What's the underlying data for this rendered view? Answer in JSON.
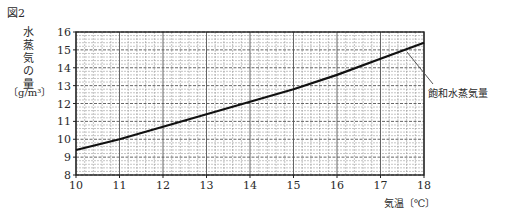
{
  "figure": {
    "label": "図2",
    "ylabel_chars": [
      "水",
      "蒸",
      "気",
      "の",
      "量"
    ],
    "ylabel_unit": "〔g/m³〕",
    "xlabel": "気温〔℃〕",
    "series_label": "飽和水蒸気量"
  },
  "chart_data": {
    "type": "line",
    "title": "図2",
    "xlabel": "気温〔℃〕",
    "ylabel": "水蒸気の量〔g/m³〕",
    "xlim": [
      10,
      18
    ],
    "ylim": [
      8,
      16
    ],
    "x_ticks": [
      10,
      11,
      12,
      13,
      14,
      15,
      16,
      17,
      18
    ],
    "y_ticks": [
      8,
      9,
      10,
      11,
      12,
      13,
      14,
      15,
      16
    ],
    "grid": {
      "on": true,
      "minor_step_x": 0.2,
      "minor_step_y": 0.2
    },
    "legend": {
      "position": "annotation-right",
      "entries": [
        "飽和水蒸気量"
      ]
    },
    "series": [
      {
        "name": "飽和水蒸気量",
        "x": [
          10,
          11,
          12,
          13,
          14,
          15,
          16,
          17,
          18
        ],
        "values": [
          9.4,
          10.0,
          10.7,
          11.4,
          12.1,
          12.8,
          13.6,
          14.5,
          15.4
        ]
      }
    ]
  },
  "style": {
    "line_color": "#111111",
    "grid_color": "#8a8a8a",
    "axis_color": "#222222",
    "leader_color": "#555555"
  }
}
